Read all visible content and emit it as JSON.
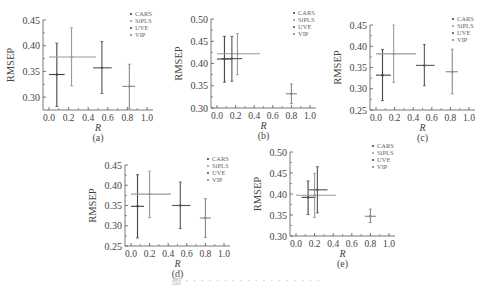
{
  "figure": {
    "caption": "图 · · · · · · · · · · · · · · · · · ·",
    "colors": {
      "axis": "#555555",
      "CARS": "#444444",
      "SiPLS": "#999999",
      "UVE": "#555555",
      "VIP": "#888888",
      "text": "#444444"
    }
  },
  "chart_data": [
    {
      "panel": "(a)",
      "type": "scatter",
      "title": "",
      "xlabel": "R",
      "ylabel": "RMSEP",
      "xlim": [
        0.0,
        1.0
      ],
      "ylim": [
        0.275,
        0.45
      ],
      "xticks": [
        "0.0",
        "0.2",
        "0.4",
        "0.6",
        "0.8",
        "1.0"
      ],
      "yticks": [
        "0.30",
        "0.35",
        "0.40",
        "0.45"
      ],
      "legend": [
        "CARS",
        "SiPLS",
        "UVE",
        "VIP"
      ],
      "legend_position": "upper right",
      "grid": false,
      "series": [
        {
          "name": "CARS",
          "x": 0.08,
          "y": 0.344,
          "xerr": [
            0.0,
            0.16
          ],
          "yerr": [
            0.282,
            0.405
          ]
        },
        {
          "name": "SiPLS",
          "x": 0.23,
          "y": 0.378,
          "xerr": [
            0.0,
            0.48
          ],
          "yerr": [
            0.322,
            0.435
          ]
        },
        {
          "name": "UVE",
          "x": 0.54,
          "y": 0.357,
          "xerr": [
            0.45,
            0.64
          ],
          "yerr": [
            0.307,
            0.408
          ]
        },
        {
          "name": "VIP",
          "x": 0.82,
          "y": 0.321,
          "xerr": [
            0.75,
            0.88
          ],
          "yerr": [
            0.278,
            0.364
          ]
        }
      ]
    },
    {
      "panel": "(b)",
      "type": "scatter",
      "title": "",
      "xlabel": "R",
      "ylabel": "RMSEP",
      "xlim": [
        0.0,
        1.0
      ],
      "ylim": [
        0.3,
        0.5
      ],
      "xticks": [
        "0.0",
        "0.2",
        "0.4",
        "0.6",
        "0.8",
        "1.0"
      ],
      "yticks": [
        "0.30",
        "0.35",
        "0.40",
        "0.45",
        "0.50"
      ],
      "legend": [
        "CARS",
        "SiPLS",
        "UVE",
        "VIP"
      ],
      "legend_position": "upper right",
      "grid": false,
      "series": [
        {
          "name": "CARS",
          "x": 0.08,
          "y": 0.41,
          "xerr": [
            0.0,
            0.16
          ],
          "yerr": [
            0.358,
            0.461
          ]
        },
        {
          "name": "SiPLS",
          "x": 0.22,
          "y": 0.422,
          "xerr": [
            0.0,
            0.46
          ],
          "yerr": [
            0.375,
            0.467
          ]
        },
        {
          "name": "UVE",
          "x": 0.16,
          "y": 0.411,
          "xerr": [
            0.05,
            0.27
          ],
          "yerr": [
            0.36,
            0.461
          ]
        },
        {
          "name": "VIP",
          "x": 0.8,
          "y": 0.332,
          "xerr": [
            0.74,
            0.86
          ],
          "yerr": [
            0.31,
            0.354
          ]
        }
      ]
    },
    {
      "panel": "(c)",
      "type": "scatter",
      "title": "",
      "xlabel": "R",
      "ylabel": "RMSEP",
      "xlim": [
        0.0,
        1.0
      ],
      "ylim": [
        0.25,
        0.45
      ],
      "xticks": [
        "0.0",
        "0.2",
        "0.4",
        "0.6",
        "0.8",
        "1.0"
      ],
      "yticks": [
        "0.25",
        "0.30",
        "0.35",
        "0.40",
        "0.45"
      ],
      "legend": [
        "CARS",
        "SiPLS",
        "UVE",
        "VIP"
      ],
      "legend_position": "upper right",
      "grid": false,
      "series": [
        {
          "name": "CARS",
          "x": 0.07,
          "y": 0.332,
          "xerr": [
            0.0,
            0.16
          ],
          "yerr": [
            0.272,
            0.392
          ]
        },
        {
          "name": "SiPLS",
          "x": 0.19,
          "y": 0.382,
          "xerr": [
            0.0,
            0.43
          ],
          "yerr": [
            0.315,
            0.45
          ]
        },
        {
          "name": "UVE",
          "x": 0.52,
          "y": 0.355,
          "xerr": [
            0.43,
            0.63
          ],
          "yerr": [
            0.307,
            0.404
          ]
        },
        {
          "name": "VIP",
          "x": 0.82,
          "y": 0.34,
          "xerr": [
            0.75,
            0.88
          ],
          "yerr": [
            0.288,
            0.393
          ]
        }
      ]
    },
    {
      "panel": "(d)",
      "type": "scatter",
      "title": "",
      "xlabel": "R",
      "ylabel": "RMSEP",
      "xlim": [
        0.0,
        1.0
      ],
      "ylim": [
        0.25,
        0.45
      ],
      "xticks": [
        "0.0",
        "0.2",
        "0.4",
        "0.6",
        "0.8",
        "1.0"
      ],
      "yticks": [
        "0.25",
        "0.30",
        "0.35",
        "0.40",
        "0.45"
      ],
      "legend": [
        "CARS",
        "SiPLS",
        "UVE",
        "VIP"
      ],
      "legend_position": "upper right",
      "grid": false,
      "series": [
        {
          "name": "CARS",
          "x": 0.07,
          "y": 0.348,
          "xerr": [
            0.0,
            0.14
          ],
          "yerr": [
            0.27,
            0.426
          ]
        },
        {
          "name": "SiPLS",
          "x": 0.2,
          "y": 0.378,
          "xerr": [
            0.0,
            0.43
          ],
          "yerr": [
            0.32,
            0.435
          ]
        },
        {
          "name": "UVE",
          "x": 0.53,
          "y": 0.35,
          "xerr": [
            0.44,
            0.64
          ],
          "yerr": [
            0.293,
            0.408
          ]
        },
        {
          "name": "VIP",
          "x": 0.8,
          "y": 0.319,
          "xerr": [
            0.74,
            0.86
          ],
          "yerr": [
            0.271,
            0.367
          ]
        }
      ]
    },
    {
      "panel": "(e)",
      "type": "scatter",
      "title": "",
      "xlabel": "R",
      "ylabel": "RMSEP",
      "xlim": [
        0.0,
        1.0
      ],
      "ylim": [
        0.3,
        0.5
      ],
      "xticks": [
        "0.0",
        "0.2",
        "0.4",
        "0.6",
        "0.8",
        "1.0"
      ],
      "yticks": [
        "0.30",
        "0.35",
        "0.40",
        "0.45",
        "0.50"
      ],
      "legend": [
        "CARS",
        "SiPLS",
        "UVE",
        "VIP"
      ],
      "legend_position": "upper right",
      "grid": false,
      "series": [
        {
          "name": "CARS",
          "x": 0.13,
          "y": 0.392,
          "xerr": [
            0.06,
            0.21
          ],
          "yerr": [
            0.351,
            0.431
          ]
        },
        {
          "name": "SiPLS",
          "x": 0.2,
          "y": 0.397,
          "xerr": [
            0.0,
            0.43
          ],
          "yerr": [
            0.344,
            0.449
          ]
        },
        {
          "name": "UVE",
          "x": 0.23,
          "y": 0.41,
          "xerr": [
            0.14,
            0.34
          ],
          "yerr": [
            0.355,
            0.465
          ]
        },
        {
          "name": "VIP",
          "x": 0.8,
          "y": 0.347,
          "xerr": [
            0.74,
            0.86
          ],
          "yerr": [
            0.332,
            0.364
          ]
        }
      ]
    }
  ],
  "layout": [
    {
      "left": 0,
      "top": 0,
      "width": 165,
      "height": 136,
      "plot": {
        "x0": 43,
        "y0": 20,
        "x1": 153,
        "y1": 110
      }
    },
    {
      "left": 163,
      "top": 0,
      "width": 165,
      "height": 136,
      "plot": {
        "x0": 48,
        "y0": 19,
        "x1": 153,
        "y1": 108
      }
    },
    {
      "left": 325,
      "top": 0,
      "width": 167,
      "height": 136,
      "plot": {
        "x0": 45,
        "y0": 25,
        "x1": 150,
        "y1": 110
      }
    },
    {
      "left": 80,
      "top": 136,
      "width": 165,
      "height": 132,
      "plot": {
        "x0": 45,
        "y0": 29,
        "x1": 150,
        "y1": 110
      }
    },
    {
      "left": 245,
      "top": 136,
      "width": 165,
      "height": 132,
      "plot": {
        "x0": 45,
        "y0": 16,
        "x1": 150,
        "y1": 100
      }
    }
  ]
}
